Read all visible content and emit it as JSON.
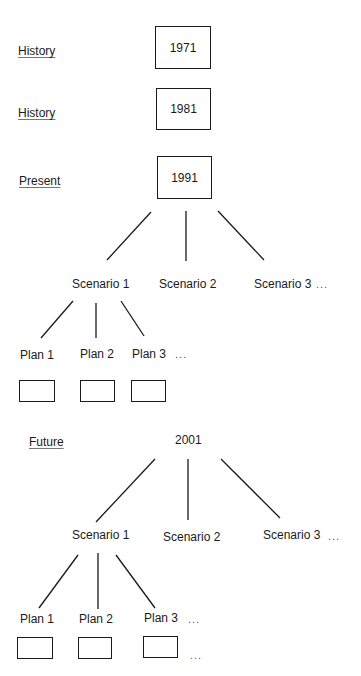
{
  "diagram": {
    "eras": [
      {
        "label": "History",
        "year": "1971",
        "boxed": true
      },
      {
        "label": "History",
        "year": "1981",
        "boxed": true
      },
      {
        "label": "Present",
        "year": "1991",
        "boxed": true
      },
      {
        "label": "Future",
        "year": "2001",
        "boxed": false
      }
    ],
    "present_tree": {
      "scenarios": [
        "Scenario 1",
        "Scenario 2",
        "Scenario 3"
      ],
      "scenarios_more": "...",
      "plans": [
        "Plan 1",
        "Plan 2",
        "Plan 3"
      ],
      "plans_more": "..."
    },
    "future_tree": {
      "scenarios": [
        "Scenario 1",
        "Scenario 2",
        "Scenario 3"
      ],
      "scenarios_more": "...",
      "plans": [
        "Plan 1",
        "Plan 2",
        "Plan 3"
      ],
      "plans_more": "...",
      "boxes_more": "..."
    }
  }
}
